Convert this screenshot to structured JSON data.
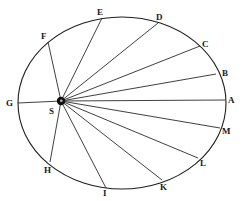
{
  "diagram": {
    "title": "",
    "colors": {
      "ink": "#1e1e1e",
      "background": "#ffffff"
    },
    "orbit": {
      "cx": 122,
      "cy": 103,
      "rx": 104,
      "ry": 86
    },
    "focus": {
      "label": "S",
      "x": 61,
      "y": 101,
      "label_x": 49,
      "label_y": 114
    },
    "points": [
      {
        "label": "A",
        "x": 225,
        "y": 100,
        "label_x": 228,
        "label_y": 103
      },
      {
        "label": "B",
        "x": 216,
        "y": 74,
        "label_x": 222,
        "label_y": 76
      },
      {
        "label": "C",
        "x": 200,
        "y": 46,
        "label_x": 202,
        "label_y": 47
      },
      {
        "label": "D",
        "x": 158,
        "y": 23,
        "label_x": 156,
        "label_y": 20
      },
      {
        "label": "E",
        "x": 102,
        "y": 18,
        "label_x": 97,
        "label_y": 15
      },
      {
        "label": "F",
        "x": 48,
        "y": 42,
        "label_x": 41,
        "label_y": 39
      },
      {
        "label": "G",
        "x": 18,
        "y": 103,
        "label_x": 6,
        "label_y": 106
      },
      {
        "label": "H",
        "x": 50,
        "y": 162,
        "label_x": 44,
        "label_y": 173
      },
      {
        "label": "I",
        "x": 106,
        "y": 188,
        "label_x": 103,
        "label_y": 196
      },
      {
        "label": "K",
        "x": 162,
        "y": 180,
        "label_x": 160,
        "label_y": 190
      },
      {
        "label": "L",
        "x": 198,
        "y": 158,
        "label_x": 200,
        "label_y": 166
      },
      {
        "label": "M",
        "x": 220,
        "y": 128,
        "label_x": 222,
        "label_y": 134
      }
    ]
  }
}
